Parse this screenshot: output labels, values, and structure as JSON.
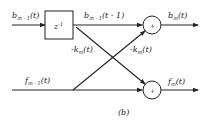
{
  "diagram": {
    "caption": "(b)",
    "delay_block": {
      "label": "z",
      "sup": "-1"
    },
    "adders": [
      {
        "id": "top-adder",
        "symbol": "+"
      },
      {
        "id": "bottom-adder",
        "symbol": "+"
      }
    ],
    "labels": {
      "b_in": {
        "base": "b",
        "sub": "m - 1",
        "arg": "(t)"
      },
      "b_delayed": {
        "base": "b",
        "sub": "m - 1",
        "arg": "(t - 1)"
      },
      "b_out": {
        "base": "b",
        "sub": "m",
        "arg": "(t)"
      },
      "f_in": {
        "base": "f",
        "sub": "m - 1",
        "arg": "(t)"
      },
      "f_out": {
        "base": "f",
        "sub": "m",
        "arg": "(t)"
      },
      "k_left": {
        "base": "-k",
        "sub": "m",
        "arg": "(t)"
      },
      "k_right": {
        "base": "-k",
        "sub": "m",
        "arg": "(t)"
      }
    },
    "colors": {
      "line": "#222222",
      "background": "#ffffff"
    }
  }
}
